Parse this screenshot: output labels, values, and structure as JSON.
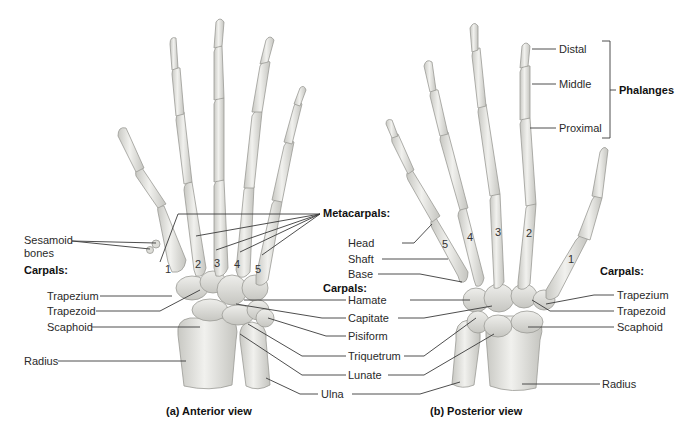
{
  "figure": {
    "views": [
      {
        "id": "anterior",
        "caption": "(a) Anterior view"
      },
      {
        "id": "posterior",
        "caption": "(b) Posterior view"
      }
    ]
  },
  "anterior_labels": {
    "sesamoid": "Sesamoid\nbones",
    "sesamoid_line1": "Sesamoid",
    "sesamoid_line2": "bones",
    "carpals_heading": "Carpals:",
    "trapezium": "Trapezium",
    "trapezoid": "Trapezoid",
    "scaphoid": "Scaphoid",
    "radius": "Radius",
    "metacarpal_numbers": [
      "1",
      "2",
      "3",
      "4",
      "5"
    ]
  },
  "center_labels": {
    "metacarpals_heading": "Metacarpals:",
    "head": "Head",
    "shaft": "Shaft",
    "base": "Base",
    "carpals_heading": "Carpals:",
    "hamate": "Hamate",
    "capitate": "Capitate",
    "pisiform": "Pisiform",
    "triquetrum": "Triquetrum",
    "lunate": "Lunate",
    "ulna": "Ulna"
  },
  "posterior_labels": {
    "distal": "Distal",
    "middle": "Middle",
    "proximal": "Proximal",
    "phalanges_heading": "Phalanges",
    "carpals_heading": "Carpals:",
    "trapezium": "Trapezium",
    "trapezoid": "Trapezoid",
    "scaphoid": "Scaphoid",
    "radius": "Radius",
    "metacarpal_numbers": [
      "5",
      "4",
      "3",
      "2",
      "1"
    ]
  },
  "colors": {
    "bone_fill": "#e9e9e6",
    "bone_shade": "#c9c9c4",
    "bone_outline": "#9a9a95",
    "leader_line": "#3a3a3a",
    "background": "#ffffff"
  }
}
